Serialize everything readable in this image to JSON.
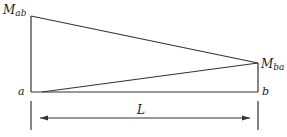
{
  "diagram": {
    "type": "bending-moment-diagram",
    "labels": {
      "moment_left": "M",
      "moment_left_sub": "ab",
      "moment_right": "M",
      "moment_right_sub": "ba",
      "node_left": "a",
      "node_right": "b",
      "span": "L"
    },
    "colors": {
      "stroke": "#333333",
      "background": "#ffffff"
    }
  }
}
